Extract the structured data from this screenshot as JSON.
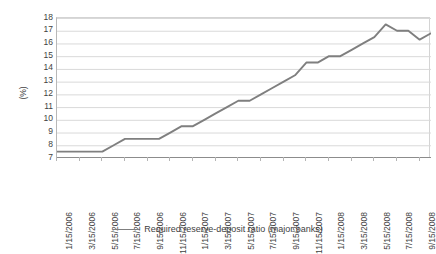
{
  "chart_data": {
    "type": "line",
    "title": "",
    "xlabel": "",
    "ylabel": "(%)",
    "ylim": [
      7,
      18
    ],
    "ytick_step": 1,
    "yticks": [
      18,
      17,
      16,
      15,
      14,
      13,
      12,
      11,
      10,
      9,
      8,
      7
    ],
    "grid": "horizontal",
    "legend_position": "bottom-center",
    "line_color": "#7f7f7f",
    "gridline_color": "#d9d9d9",
    "axis_color": "#8c8c8c",
    "xtick_labels": [
      "1/15/2006",
      "3/15/2006",
      "5/15/2006",
      "7/15/2006",
      "9/15/2006",
      "11/15/2006",
      "1/15/2007",
      "3/15/2007",
      "5/15/2007",
      "7/15/2007",
      "9/15/2007",
      "11/15/2007",
      "1/15/2008",
      "3/15/2008",
      "5/15/2008",
      "7/15/2008",
      "9/15/2008"
    ],
    "series": [
      {
        "name": "Required reserve-deposit ratio (major banks)",
        "color": "#7f7f7f",
        "x": [
          "1/15/2006",
          "2/15/2006",
          "3/15/2006",
          "4/15/2006",
          "5/15/2006",
          "6/15/2006",
          "7/15/2006",
          "8/15/2006",
          "9/15/2006",
          "10/15/2006",
          "11/15/2006",
          "12/15/2006",
          "1/15/2007",
          "2/15/2007",
          "3/15/2007",
          "4/15/2007",
          "5/15/2007",
          "6/15/2007",
          "7/15/2007",
          "8/15/2007",
          "9/15/2007",
          "10/15/2007",
          "11/15/2007",
          "12/15/2007",
          "1/15/2008",
          "2/15/2008",
          "3/15/2008",
          "4/15/2008",
          "5/15/2008",
          "6/15/2008",
          "7/15/2008",
          "8/15/2008",
          "9/15/2008",
          "10/15/2008"
        ],
        "values": [
          7.5,
          7.5,
          7.5,
          7.5,
          7.5,
          8.0,
          8.5,
          8.5,
          8.5,
          8.5,
          9.0,
          9.5,
          9.5,
          10.0,
          10.5,
          11.0,
          11.5,
          11.5,
          12.0,
          12.5,
          13.0,
          13.5,
          14.5,
          14.5,
          15.0,
          15.0,
          15.5,
          16.0,
          16.5,
          17.5,
          17.0,
          17.0,
          16.3,
          16.8
        ]
      }
    ]
  },
  "legend": {
    "entries": [
      {
        "label": "Required reserve-deposit ratio (major banks)",
        "marker": "line-swatch"
      }
    ]
  },
  "axis": {
    "y_title": "(%)"
  }
}
